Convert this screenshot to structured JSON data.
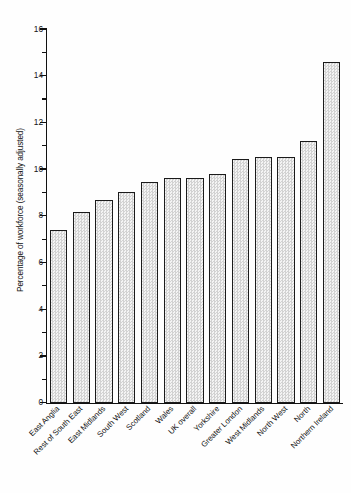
{
  "chart_data": {
    "type": "bar",
    "title": "",
    "xlabel": "",
    "ylabel": "Percentage of workforce (seasonally adjusted)",
    "ylim": [
      0,
      16
    ],
    "ytick_values": [
      0,
      2,
      4,
      6,
      8,
      10,
      12,
      14,
      16
    ],
    "ytick_labels": [
      "0",
      "2",
      "4",
      "6",
      "8",
      "10",
      "12",
      "14",
      "16"
    ],
    "yminor_values": [
      1,
      3,
      5,
      7,
      9,
      11,
      13,
      15
    ],
    "grid": false,
    "legend": false,
    "categories": [
      "East Anglia",
      "Rest of South East",
      "East Midlands",
      "South West",
      "Scotland",
      "Wales",
      "UK overall",
      "Yorkshire",
      "Greater London",
      "West Midlands",
      "North West",
      "North",
      "Northern Ireland"
    ],
    "values": [
      7.4,
      8.2,
      8.7,
      9.05,
      9.45,
      9.65,
      9.65,
      9.8,
      10.45,
      10.55,
      10.55,
      11.2,
      14.6
    ],
    "bar_fill_color": "#e8e8e8",
    "bar_edge_color": "#1b1b1b"
  }
}
